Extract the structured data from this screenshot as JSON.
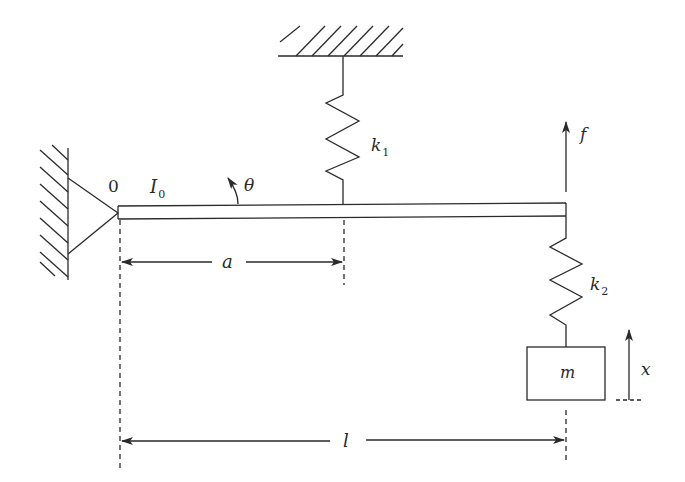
{
  "diagram": {
    "type": "mechanical-vibration-system",
    "colors": {
      "stroke": "#2a2a2a",
      "background": "#ffffff"
    },
    "labels": {
      "pivot": "0",
      "inertia": "I",
      "inertia_sub": "0",
      "rotation": "θ",
      "spring1": "k",
      "spring1_sub": "1",
      "spring2": "k",
      "spring2_sub": "2",
      "force": "f",
      "mass": "m",
      "displacement": "x",
      "dim_a": "a",
      "dim_l": "l"
    }
  }
}
